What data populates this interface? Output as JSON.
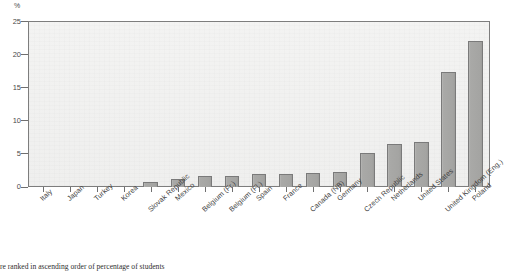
{
  "chart_data": {
    "type": "bar",
    "title": "",
    "subtitle": "",
    "xlabel": "",
    "ylabel": "%",
    "ylim": [
      0,
      25
    ],
    "yticks": [
      0,
      5,
      10,
      15,
      20,
      25
    ],
    "grid": false,
    "legend": "none",
    "orientation": "vertical",
    "sort": "ascending",
    "categories": [
      "Italy",
      "Japan",
      "Turkey",
      "Korea",
      "Slovak Republic",
      "Mexico",
      "Belgium (Fr.)",
      "Belgium (Fl.)",
      "Spain",
      "France",
      "Canada (NB)",
      "Germany",
      "Czech Republic",
      "Netherlands",
      "United States",
      "United Kingdom (Eng.)",
      "Poland"
    ],
    "values": [
      0.0,
      0.0,
      0.0,
      0.2,
      0.8,
      1.2,
      1.6,
      1.6,
      2.0,
      2.0,
      2.1,
      2.3,
      5.1,
      6.5,
      6.8,
      17.3,
      22.0
    ],
    "bar_color": "#a6a6a4",
    "bar_edge_color": "#7a7a7a",
    "plot_background": "#f1f1f0",
    "axis_color": "#6f6f6f"
  },
  "axis": {
    "unit_label": "%",
    "tick_labels": [
      "25",
      "20",
      "15",
      "10",
      "5",
      "0"
    ]
  },
  "footnote": {
    "text": "re ranked in ascending order of percentage of students"
  }
}
